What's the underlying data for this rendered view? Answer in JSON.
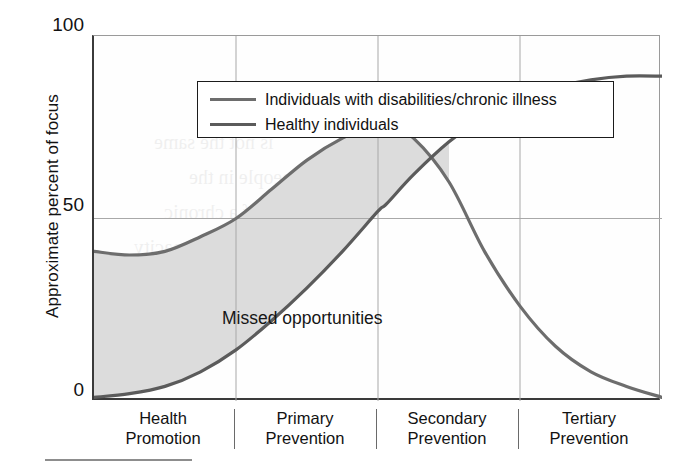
{
  "chart_data": {
    "type": "line",
    "title": "",
    "xlabel": "",
    "ylabel": "Approximate percent of focus",
    "ylim": [
      0,
      100
    ],
    "yticks": [
      0,
      50,
      100
    ],
    "ytick_labels": [
      "0",
      "50",
      "100"
    ],
    "xlim": [
      0,
      4
    ],
    "grid": true,
    "grid_x_positions": [
      1,
      2,
      3
    ],
    "grid_y_positions": [
      50
    ],
    "legend_position": "upper left",
    "categories": [
      "Health Promotion",
      "Primary Prevention",
      "Secondary Prevention",
      "Tertiary Prevention"
    ],
    "annotations": [
      {
        "text": "Missed opportunities",
        "x": 0.63,
        "y": 27,
        "description": "Label for the shaded gap between the two curves"
      }
    ],
    "shaded_region": {
      "label": "Missed opportunities",
      "between": [
        "Individuals with disabilities/chronic illness",
        "Healthy individuals"
      ],
      "x_range": [
        0,
        2.6
      ],
      "color": "#dcdcdc"
    },
    "series": [
      {
        "name": "Individuals with disabilities/chronic illness",
        "color": "#6d6d6d",
        "x": [
          0.0,
          0.25,
          0.5,
          0.75,
          1.0,
          1.25,
          1.5,
          1.75,
          2.0,
          2.06,
          2.25,
          2.5,
          2.75,
          3.0,
          3.25,
          3.5,
          3.75,
          4.0
        ],
        "values": [
          41,
          40,
          41,
          45,
          50,
          58,
          66,
          72,
          76,
          76,
          72,
          60,
          41,
          26,
          15,
          8,
          4,
          1
        ]
      },
      {
        "name": "Healthy individuals",
        "color": "#5b5b5b",
        "x": [
          0.0,
          0.25,
          0.5,
          0.75,
          1.0,
          1.25,
          1.5,
          1.75,
          2.0,
          2.06,
          2.25,
          2.5,
          2.75,
          3.0,
          3.25,
          3.5,
          3.75,
          4.0
        ],
        "values": [
          1,
          2,
          4,
          8,
          14,
          22,
          31,
          41,
          52,
          54,
          62,
          71,
          78,
          83,
          86,
          88,
          89,
          89
        ]
      }
    ]
  },
  "yaxis": {
    "title": "Approximate percent of focus",
    "tick_100": "100",
    "tick_50": "50",
    "tick_0": "0"
  },
  "legend": {
    "items": [
      {
        "label": "Individuals with disabilities/chronic illness",
        "color": "#6d6d6d"
      },
      {
        "label": "Healthy individuals",
        "color": "#5b5b5b"
      }
    ]
  },
  "xaxis": {
    "categories": [
      {
        "line1": "Health",
        "line2": "Promotion"
      },
      {
        "line1": "Primary",
        "line2": "Prevention"
      },
      {
        "line1": "Secondary",
        "line2": "Prevention"
      },
      {
        "line1": "Tertiary",
        "line2": "Prevention"
      }
    ]
  },
  "plot_annotation": {
    "missed_opportunities": "Missed opportunities"
  },
  "bleed_through": {
    "lines": [
      "is not the same",
      "the people in the",
      "risk of a chronic",
      "as functional capacity",
      "and based",
      "focus on",
      "health"
    ]
  },
  "colors": {
    "curve_disabilities": "#6d6d6d",
    "curve_healthy": "#5b5b5b",
    "shaded_area": "#dcdcdc",
    "axis": "#3a3a3a",
    "gridline": "#a8a8a8",
    "background": "#ffffff"
  }
}
